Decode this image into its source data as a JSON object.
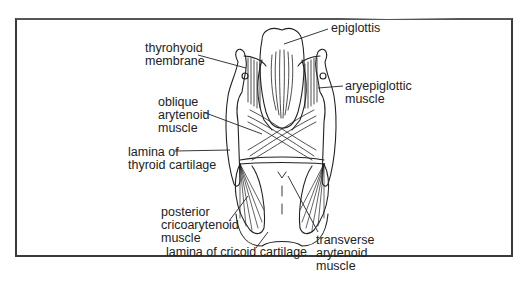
{
  "figure": {
    "labels": {
      "thyrohyoid": [
        "thyrohyoid",
        "membrane"
      ],
      "epiglottis": [
        "epiglottis"
      ],
      "aryepiglottic": [
        "aryepiglottic",
        "muscle"
      ],
      "oblique": [
        "oblique",
        "arytenoid",
        "muscle"
      ],
      "thyroid_lamina": [
        "lamina of",
        "thyroid cartilage"
      ],
      "posterior_crico": [
        "posterior",
        "cricoarytenoid",
        "muscle"
      ],
      "cricoid_lamina": [
        "lamina of cricoid cartilage"
      ],
      "transverse": [
        "transverse",
        "arytenoid",
        "muscle"
      ]
    }
  }
}
